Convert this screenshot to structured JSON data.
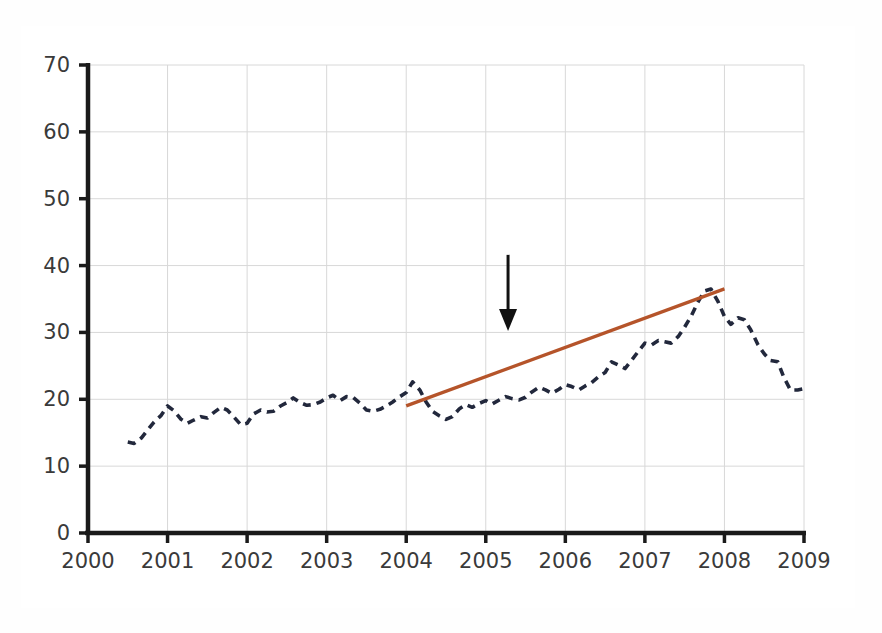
{
  "figure": {
    "background_color": "#ffffff",
    "frame_color": "#8d8d8d",
    "axis_color": "#1a1a1a",
    "grid_color": "#d8d8d8"
  },
  "chart_data": {
    "type": "line",
    "title": "",
    "subtitle": "",
    "xlabel": "",
    "ylabel": "",
    "xlim": [
      2000,
      2009
    ],
    "ylim": [
      0,
      70
    ],
    "grid": true,
    "legend_position": "none",
    "x_tick_labels": [
      "2000",
      "2001",
      "2002",
      "2003",
      "2004",
      "2005",
      "2006",
      "2007",
      "2008",
      "2009"
    ],
    "x_ticks": [
      2000,
      2001,
      2002,
      2003,
      2004,
      2005,
      2006,
      2007,
      2008,
      2009
    ],
    "y_tick_labels": [
      "0",
      "10",
      "20",
      "30",
      "40",
      "50",
      "60",
      "70"
    ],
    "y_ticks": [
      0,
      10,
      20,
      30,
      40,
      50,
      60,
      70
    ],
    "series": [
      {
        "name": "observed-series",
        "style": "dashed",
        "color": "#22283c",
        "x": [
          2000.5,
          2000.58,
          2000.67,
          2000.75,
          2000.83,
          2000.92,
          2001.0,
          2001.08,
          2001.17,
          2001.25,
          2001.33,
          2001.42,
          2001.5,
          2001.58,
          2001.67,
          2001.75,
          2001.83,
          2001.92,
          2002.0,
          2002.08,
          2002.17,
          2002.25,
          2002.33,
          2002.42,
          2002.5,
          2002.58,
          2002.67,
          2002.75,
          2002.83,
          2002.92,
          2003.0,
          2003.08,
          2003.17,
          2003.25,
          2003.33,
          2003.42,
          2003.5,
          2003.58,
          2003.67,
          2003.75,
          2003.83,
          2003.92,
          2004.0,
          2004.08,
          2004.17,
          2004.25,
          2004.33,
          2004.42,
          2004.5,
          2004.58,
          2004.67,
          2004.75,
          2004.83,
          2004.92,
          2005.0,
          2005.08,
          2005.17,
          2005.25,
          2005.33,
          2005.42,
          2005.5,
          2005.58,
          2005.67,
          2005.75,
          2005.83,
          2005.92,
          2006.0,
          2006.08,
          2006.17,
          2006.25,
          2006.33,
          2006.42,
          2006.5,
          2006.58,
          2006.67,
          2006.75,
          2006.83,
          2006.92,
          2007.0,
          2007.08,
          2007.17,
          2007.25,
          2007.33,
          2007.42,
          2007.5,
          2007.58,
          2007.67,
          2007.75,
          2007.83,
          2007.92,
          2008.0,
          2008.08,
          2008.17,
          2008.25,
          2008.33,
          2008.42,
          2008.5,
          2008.58,
          2008.67,
          2008.75,
          2008.83,
          2008.92,
          2009.0
        ],
        "y": [
          13.6,
          13.4,
          14.2,
          15.4,
          16.6,
          17.6,
          19.0,
          18.3,
          17.0,
          16.4,
          16.9,
          17.4,
          17.2,
          18.0,
          18.8,
          18.4,
          17.4,
          16.2,
          16.4,
          17.8,
          18.4,
          18.1,
          18.2,
          19.0,
          19.5,
          20.2,
          19.5,
          19.1,
          19.2,
          19.6,
          20.2,
          20.6,
          19.8,
          20.4,
          20.3,
          19.4,
          18.4,
          18.2,
          18.5,
          19.0,
          19.6,
          20.4,
          21.0,
          22.6,
          21.4,
          19.6,
          18.2,
          17.5,
          17.0,
          17.4,
          18.6,
          19.2,
          18.8,
          19.4,
          19.8,
          19.3,
          19.9,
          20.4,
          20.1,
          19.9,
          20.3,
          21.1,
          21.8,
          21.4,
          20.9,
          21.5,
          22.2,
          21.9,
          21.4,
          22.0,
          22.5,
          23.4,
          24.0,
          25.6,
          25.1,
          24.6,
          25.8,
          27.2,
          28.4,
          28.1,
          28.8,
          28.6,
          28.4,
          29.4,
          30.8,
          32.4,
          34.6,
          36.2,
          36.5,
          34.6,
          32.4,
          31.2,
          32.2,
          31.9,
          30.4,
          28.2,
          26.8,
          25.8,
          25.6,
          23.2,
          21.4,
          21.4,
          21.6
        ]
      },
      {
        "name": "trend-line",
        "style": "solid",
        "color": "#b5542a",
        "x": [
          2004.0,
          2008.0
        ],
        "y": [
          19.0,
          36.5
        ]
      }
    ],
    "annotations": [
      {
        "name": "down-arrow",
        "type": "arrow",
        "direction": "down",
        "x": 2005.28,
        "y_start": 41.6,
        "y_end": 30.2,
        "color": "#111111"
      }
    ]
  }
}
